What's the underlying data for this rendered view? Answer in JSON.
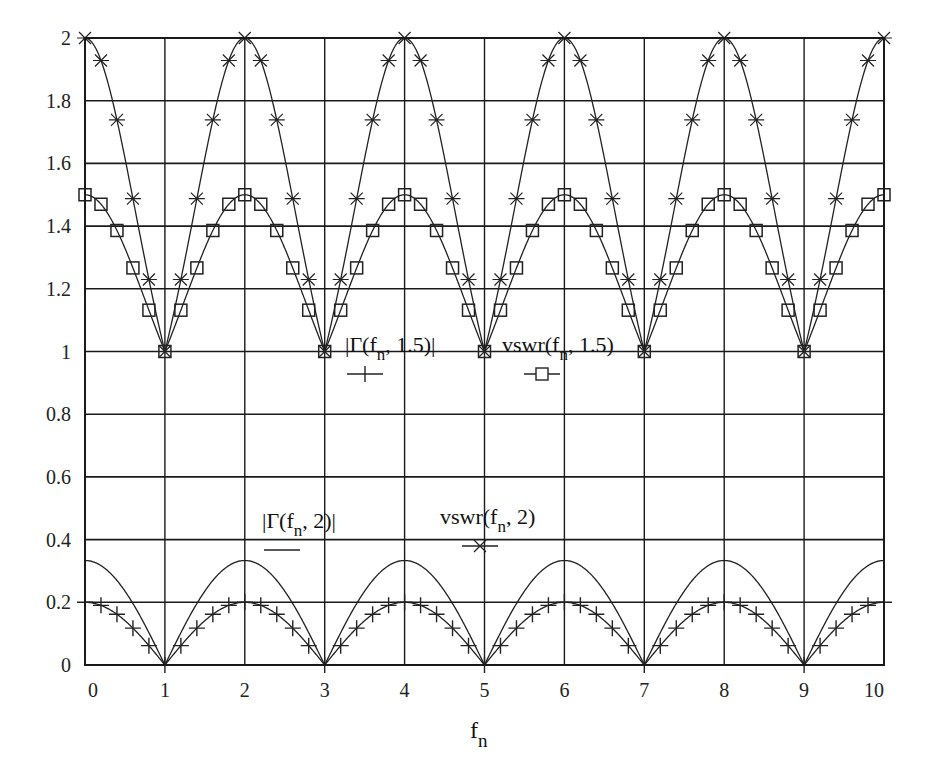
{
  "chart_data": {
    "type": "line",
    "title": "",
    "xlabel": "f_n",
    "xlabel_main": "f",
    "xlabel_sub": "n",
    "ylabel": "",
    "xlim": [
      0,
      10
    ],
    "ylim": [
      0,
      2
    ],
    "grid": true,
    "x_ticks": [
      "0",
      "1",
      "2",
      "3",
      "4",
      "5",
      "6",
      "7",
      "8",
      "9",
      "10"
    ],
    "y_ticks": [
      "0",
      "0.2",
      "0.4",
      "0.6",
      "0.8",
      "1",
      "1.2",
      "1.4",
      "1.6",
      "1.8",
      "2"
    ],
    "marker_step": 0.2,
    "x": [
      0,
      0.2,
      0.4,
      0.6,
      0.8,
      1,
      1.2,
      1.4,
      1.6,
      1.8,
      2,
      2.2,
      2.4,
      2.6,
      2.8,
      3,
      3.2,
      3.4,
      3.6,
      3.8,
      4,
      4.2,
      4.4,
      4.6,
      4.8,
      5,
      5.2,
      5.4,
      5.6,
      5.8,
      6,
      6.2,
      6.4,
      6.6,
      6.8,
      7,
      7.2,
      7.4,
      7.6,
      7.8,
      8,
      8.2,
      8.4,
      8.6,
      8.8,
      9,
      9.2,
      9.4,
      9.6,
      9.8,
      10
    ],
    "series": [
      {
        "name": "|Γ(f_n, 1.5)|",
        "legend_main": "|Γ(f",
        "legend_sub": "n",
        "legend_tail": ", 1.5)|",
        "marker": "plus",
        "values": [
          0.2,
          0.1902,
          0.1618,
          0.1176,
          0.0618,
          0,
          0.0618,
          0.1176,
          0.1618,
          0.1902,
          0.2,
          0.1902,
          0.1618,
          0.1176,
          0.0618,
          0,
          0.0618,
          0.1176,
          0.1618,
          0.1902,
          0.2,
          0.1902,
          0.1618,
          0.1176,
          0.0618,
          0,
          0.0618,
          0.1176,
          0.1618,
          0.1902,
          0.2,
          0.1902,
          0.1618,
          0.1176,
          0.0618,
          0,
          0.0618,
          0.1176,
          0.1618,
          0.1902,
          0.2,
          0.1902,
          0.1618,
          0.1176,
          0.0618,
          0,
          0.0618,
          0.1176,
          0.1618,
          0.1902,
          0.2
        ]
      },
      {
        "name": "vswr(f_n, 1.5)",
        "legend_main": "vswr(f",
        "legend_sub": "n",
        "legend_tail": ", 1.5)",
        "marker": "square",
        "values": [
          1.5,
          1.4697,
          1.386,
          1.2666,
          1.1318,
          1,
          1.1318,
          1.2666,
          1.386,
          1.4697,
          1.5,
          1.4697,
          1.386,
          1.2666,
          1.1318,
          1,
          1.1318,
          1.2666,
          1.386,
          1.4697,
          1.5,
          1.4697,
          1.386,
          1.2666,
          1.1318,
          1,
          1.1318,
          1.2666,
          1.386,
          1.4697,
          1.5,
          1.4697,
          1.386,
          1.2666,
          1.1318,
          1,
          1.1318,
          1.2666,
          1.386,
          1.4697,
          1.5,
          1.4697,
          1.386,
          1.2666,
          1.1318,
          1,
          1.1318,
          1.2666,
          1.386,
          1.4697,
          1.5
        ]
      },
      {
        "name": "|Γ(f_n, 2)|",
        "legend_main": "|Γ(f",
        "legend_sub": "n",
        "legend_tail": ", 2)|",
        "marker": "none",
        "values": [
          0.3333,
          0.317,
          0.2697,
          0.1959,
          0.103,
          0,
          0.103,
          0.1959,
          0.2697,
          0.317,
          0.3333,
          0.317,
          0.2697,
          0.1959,
          0.103,
          0,
          0.103,
          0.1959,
          0.2697,
          0.317,
          0.3333,
          0.317,
          0.2697,
          0.1959,
          0.103,
          0,
          0.103,
          0.1959,
          0.2697,
          0.317,
          0.3333,
          0.317,
          0.2697,
          0.1959,
          0.103,
          0,
          0.103,
          0.1959,
          0.2697,
          0.317,
          0.3333,
          0.317,
          0.2697,
          0.1959,
          0.103,
          0,
          0.103,
          0.1959,
          0.2697,
          0.317,
          0.3333
        ]
      },
      {
        "name": "vswr(f_n, 2)",
        "legend_main": "vswr(f",
        "legend_sub": "n",
        "legend_tail": ", 2)",
        "marker": "x",
        "values": [
          2,
          1.9283,
          1.7387,
          1.4875,
          1.2297,
          1,
          1.2297,
          1.4875,
          1.7387,
          1.9283,
          2,
          1.9283,
          1.7387,
          1.4875,
          1.2297,
          1,
          1.2297,
          1.4875,
          1.7387,
          1.9283,
          2,
          1.9283,
          1.7387,
          1.4875,
          1.2297,
          1,
          1.2297,
          1.4875,
          1.7387,
          1.9283,
          2,
          1.9283,
          1.7387,
          1.4875,
          1.2297,
          1,
          1.2297,
          1.4875,
          1.7387,
          1.9283,
          2,
          1.9283,
          1.7387,
          1.4875,
          1.2297,
          1,
          1.2297,
          1.4875,
          1.7387,
          1.9283,
          2
        ]
      }
    ],
    "legend_positions": [
      {
        "series": 0,
        "x": 345,
        "y": 352
      },
      {
        "series": 1,
        "x": 502,
        "y": 352
      },
      {
        "series": 2,
        "x": 262,
        "y": 528
      },
      {
        "series": 3,
        "x": 440,
        "y": 524
      }
    ]
  },
  "style": {
    "line_color": "#222222",
    "grid_color": "#1a1a1a",
    "background": "#ffffff"
  }
}
